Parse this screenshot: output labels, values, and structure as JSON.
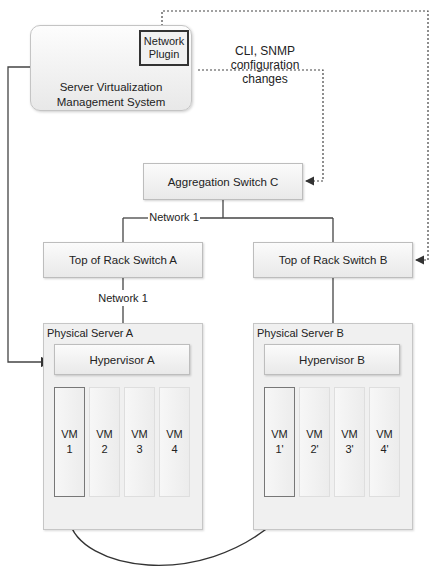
{
  "management": {
    "title_line1": "Server Virtualization",
    "title_line2": "Management System",
    "plugin_line1": "Network",
    "plugin_line2": "Plugin"
  },
  "annotation": {
    "line1": "CLI, SNMP",
    "line2": "configuration",
    "line3": "changes"
  },
  "aggregation_switch": {
    "label": "Aggregation Switch C"
  },
  "network_labels": {
    "upper": "Network 1",
    "lower": "Network 1"
  },
  "tor_switches": [
    {
      "label": "Top of Rack Switch A"
    },
    {
      "label": "Top of Rack Switch B"
    }
  ],
  "servers": [
    {
      "label": "Physical Server A",
      "hypervisor": "Hypervisor A",
      "vms": [
        {
          "name": "VM",
          "id": "1"
        },
        {
          "name": "VM",
          "id": "2"
        },
        {
          "name": "VM",
          "id": "3"
        },
        {
          "name": "VM",
          "id": "4"
        }
      ]
    },
    {
      "label": "Physical Server B",
      "hypervisor": "Hypervisor B",
      "vms": [
        {
          "name": "VM",
          "id": "1'"
        },
        {
          "name": "VM",
          "id": "2'"
        },
        {
          "name": "VM",
          "id": "3'"
        },
        {
          "name": "VM",
          "id": "4'"
        }
      ]
    }
  ],
  "colors": {
    "line": "#333333",
    "dotted": "#444444",
    "box_border": "#bdbdbd"
  }
}
